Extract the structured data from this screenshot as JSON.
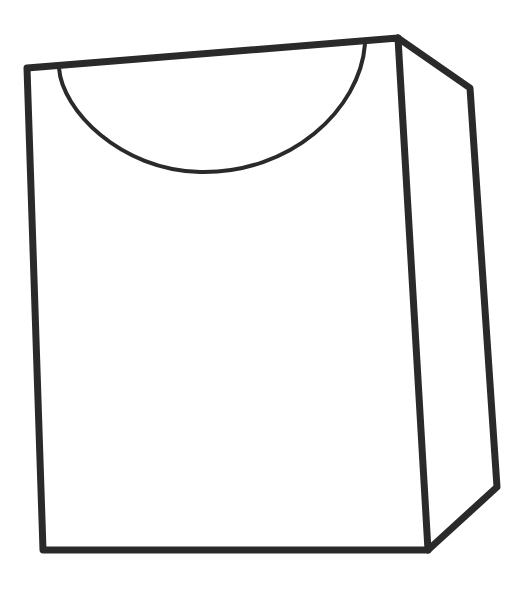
{
  "drawing": {
    "subject": "bag-outline",
    "stroke_color": "#2a2a2a",
    "background_color": "#ffffff",
    "front_face": {
      "points": [
        [
          27,
          68
        ],
        [
          398,
          38
        ],
        [
          428,
          550
        ],
        [
          43,
          550
        ]
      ],
      "stroke_width": 7
    },
    "side_face": {
      "points": [
        [
          398,
          38
        ],
        [
          470,
          88
        ],
        [
          497,
          487
        ],
        [
          428,
          550
        ]
      ],
      "stroke_width": 7
    },
    "cutout_curve": {
      "path": "M59,68 C62,110 120,170 200,172 C290,174 360,110 365,44",
      "stroke_width": 4
    }
  }
}
